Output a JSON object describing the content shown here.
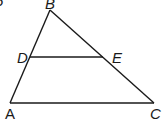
{
  "diagram": {
    "type": "triangle-with-parallel-segment",
    "corner_fragment": "5",
    "points": {
      "A": {
        "label": "A",
        "x": 10,
        "y": 103
      },
      "B": {
        "label": "B",
        "x": 50,
        "y": 10
      },
      "C": {
        "label": "C",
        "x": 154,
        "y": 103
      },
      "D": {
        "label": "D",
        "x": 30,
        "y": 57
      },
      "E": {
        "label": "E",
        "x": 103,
        "y": 57
      }
    },
    "segments": [
      "AB",
      "BC",
      "AC",
      "DE"
    ],
    "stroke_color": "#1a1a1a"
  }
}
